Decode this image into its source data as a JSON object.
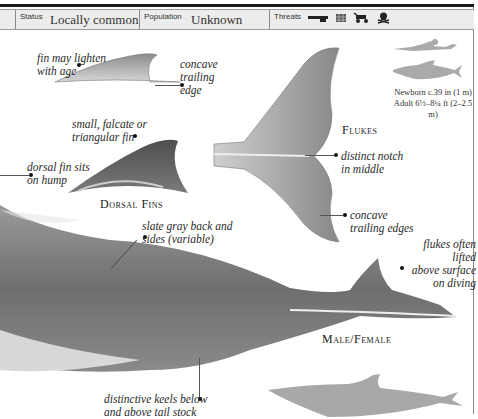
{
  "header": {
    "status": {
      "label": "Status",
      "value": "Locally common"
    },
    "population": {
      "label": "Population",
      "value": "Unknown"
    },
    "threats": {
      "label": "Threats",
      "icons": [
        "gun-icon",
        "net-icon",
        "vehicle-icon",
        "pollution-skull-icon"
      ]
    }
  },
  "scale": {
    "newborn": "Newborn c.39 in (1 m)",
    "adult": "Adult 6½–8¼ ft (2–2.5 m)"
  },
  "annotations": {
    "fin_lighten": "fin may lighten\nwith age",
    "concave_trailing_edge": "concave\ntrailing\nedge",
    "small_falcate": "small, falcate or\ntriangular fin",
    "dorsal_on_hump": "dorsal fin sits\non hump",
    "distinct_notch": "distinct notch\nin middle",
    "concave_trailing_edges": "concave\ntrailing edges",
    "slate_gray": "slate gray back and\nsides (variable)",
    "flukes_lifted": "flukes often lifted\nabove surface\non diving",
    "keels": "distinctive keels below\nand above tail stock"
  },
  "captions": {
    "dorsal_fins": "Dorsal Fins",
    "flukes": "Flukes",
    "male_female": "Male/Female"
  },
  "colors": {
    "silhouette": "#a8a8a8",
    "header_bg": "#ececec",
    "rule": "#1a1a1a"
  }
}
